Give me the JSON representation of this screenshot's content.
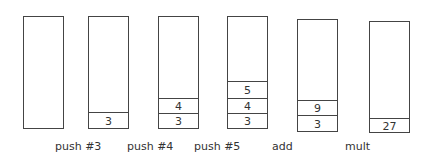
{
  "diagram": {
    "stacks": [
      {
        "id": "initial",
        "x": 23,
        "y": 16,
        "w": 41,
        "h": 113,
        "cells": []
      },
      {
        "id": "after-push-3",
        "x": 88,
        "y": 16,
        "w": 41,
        "h": 113,
        "cells": [
          {
            "value": "3",
            "top": 95
          }
        ]
      },
      {
        "id": "after-push-4",
        "x": 158,
        "y": 16,
        "w": 41,
        "h": 113,
        "cells": [
          {
            "value": "3",
            "top": 96
          },
          {
            "value": "4",
            "top": 81
          }
        ]
      },
      {
        "id": "after-push-5",
        "x": 227,
        "y": 16,
        "w": 41,
        "h": 113,
        "cells": [
          {
            "value": "3",
            "top": 96
          },
          {
            "value": "4",
            "top": 81
          },
          {
            "value": "5",
            "top": 64
          }
        ]
      },
      {
        "id": "after-add",
        "x": 297,
        "y": 19,
        "w": 41,
        "h": 113,
        "cells": [
          {
            "value": "3",
            "top": 95
          },
          {
            "value": "9",
            "top": 80
          }
        ]
      },
      {
        "id": "after-mult",
        "x": 369,
        "y": 21,
        "w": 41,
        "h": 112,
        "cells": [
          {
            "value": "27",
            "top": 96
          }
        ]
      }
    ],
    "operations": [
      {
        "label": "push #3",
        "x": 55,
        "y": 140
      },
      {
        "label": "push #4",
        "x": 127,
        "y": 140
      },
      {
        "label": "push #5",
        "x": 194,
        "y": 140
      },
      {
        "label": "add",
        "x": 272,
        "y": 140
      },
      {
        "label": "mult",
        "x": 345,
        "y": 140
      }
    ]
  }
}
